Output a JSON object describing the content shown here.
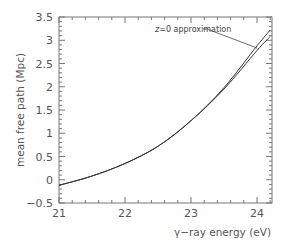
{
  "chart_data": {
    "type": "line",
    "title": "",
    "xlabel": "γ−ray energy (eV)",
    "ylabel": "mean free path (Mpc)",
    "xlim": [
      21,
      24.2
    ],
    "ylim": [
      -0.5,
      3.5
    ],
    "x_ticks": [
      "21",
      "22",
      "23",
      "24"
    ],
    "y_ticks": [
      "−0.5",
      "0",
      "0.5",
      "1",
      "1.5",
      "2",
      "2.5",
      "3",
      "3.5"
    ],
    "grid": false,
    "legend": null,
    "annotations": [
      {
        "text": "z=0 approximation",
        "points_to_series": "z=0 approximation",
        "x": 24.0,
        "y": 2.75
      }
    ],
    "series": [
      {
        "name": "full calculation",
        "x": [
          21.0,
          21.5,
          22.0,
          22.5,
          23.0,
          23.5,
          24.0,
          24.2
        ],
        "y": [
          -0.12,
          0.08,
          0.35,
          0.72,
          1.27,
          1.95,
          2.78,
          3.08
        ]
      },
      {
        "name": "z=0 approximation",
        "x": [
          21.0,
          21.5,
          22.0,
          22.5,
          23.0,
          23.5,
          24.0,
          24.2
        ],
        "y": [
          -0.12,
          0.08,
          0.35,
          0.72,
          1.27,
          1.98,
          2.88,
          3.22
        ]
      }
    ]
  }
}
